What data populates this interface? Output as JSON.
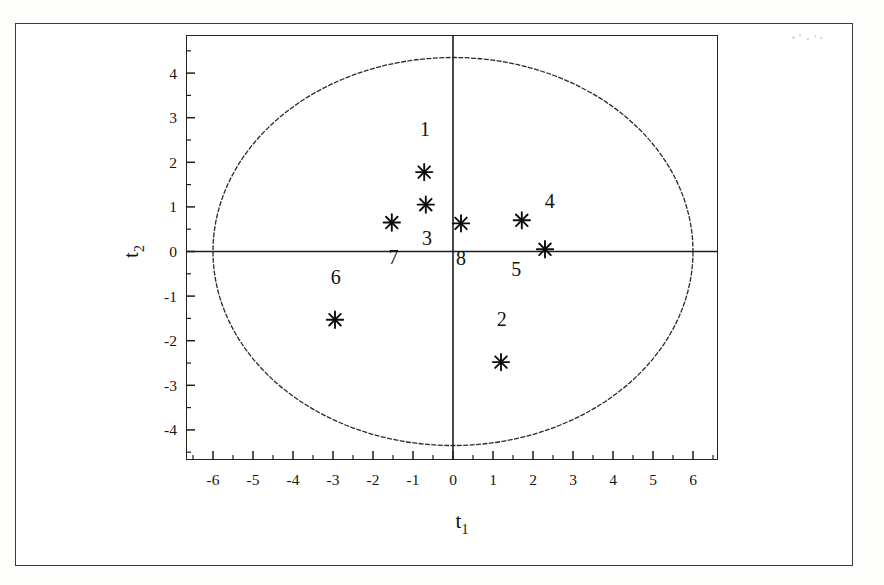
{
  "figure": {
    "background_color": "#ffffff",
    "line_color": "#1d1d1d",
    "has_outer_border": true
  },
  "chart_data": {
    "type": "scatter",
    "title": "",
    "subtitle": "",
    "xlabel": "t1",
    "ylabel": "t2",
    "xlabel_base": "t",
    "xlabel_sub": "1",
    "ylabel_base": "t",
    "ylabel_sub": "2",
    "xlim": [
      -6.65,
      6.65
    ],
    "ylim": [
      -4.72,
      4.72
    ],
    "xticks": [
      -6,
      -5,
      -4,
      -3,
      -2,
      -1,
      0,
      1,
      2,
      3,
      4,
      5,
      6
    ],
    "xtick_labels": [
      "-6",
      "-5",
      "-4",
      "-3",
      "-2",
      "-1",
      "0",
      "1",
      "2",
      "3",
      "4",
      "5",
      "6"
    ],
    "yticks": [
      -4,
      -3,
      -2,
      -1,
      0,
      1,
      2,
      3,
      4
    ],
    "ytick_labels": [
      "-4",
      "-3",
      "-2",
      "-1",
      "0",
      "1",
      "2",
      "3",
      "4"
    ],
    "minor_tick_step": 0.5,
    "grid": false,
    "legend": null,
    "zero_lines": {
      "x": 0,
      "y": 0,
      "drawn": true
    },
    "confidence_ellipse": {
      "type": "hotelling-t2-95",
      "center": [
        0,
        0
      ],
      "semi_axis_x": 6.0,
      "semi_axis_y": 4.35,
      "style": "dashed"
    },
    "marker": "asterisk",
    "points": [
      {
        "label": "1",
        "x": -0.72,
        "y": 1.78,
        "label_dx": 0.02,
        "label_dy": 0.95
      },
      {
        "label": "2",
        "x": 1.2,
        "y": -2.48,
        "label_dx": 0.02,
        "label_dy": 0.95
      },
      {
        "label": "3",
        "x": -0.68,
        "y": 1.05,
        "label_dx": 0.03,
        "label_dy": -0.78
      },
      {
        "label": "4",
        "x": 1.72,
        "y": 0.7,
        "label_dx": 0.7,
        "label_dy": 0.42
      },
      {
        "label": "5",
        "x": 2.3,
        "y": 0.05,
        "label_dx": -0.72,
        "label_dy": -0.46
      },
      {
        "label": "6",
        "x": -2.95,
        "y": -1.53,
        "label_dx": 0.02,
        "label_dy": 0.93
      },
      {
        "label": "7",
        "x": -1.53,
        "y": 0.65,
        "label_dx": 0.04,
        "label_dy": -0.8
      },
      {
        "label": "8",
        "x": 0.2,
        "y": 0.63,
        "label_dx": 0.0,
        "label_dy": -0.8
      }
    ]
  }
}
